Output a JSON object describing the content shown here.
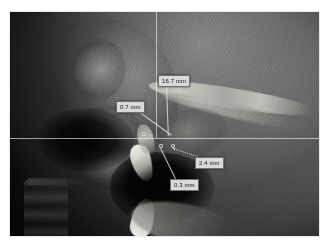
{
  "viewer": {
    "title": "CBCT Sagittal Slice Viewer",
    "modality": "CBCT sagittal slice",
    "frame_border_color": "#ffffff",
    "background_color": "#050505"
  },
  "crosshair": {
    "color": "#f4f4f4",
    "horizontal_y": 126,
    "vertical_x": 146
  },
  "measurements": [
    {
      "id": "measurement-1",
      "name": "airway-length",
      "value": "16.7 mm",
      "label_x": 148,
      "label_y": 63,
      "leader_x": 157,
      "leader_y": 72,
      "leader_length": 52,
      "leader_angle": 88
    },
    {
      "id": "measurement-2",
      "name": "anterior-gap",
      "value": "0.7 mm",
      "label_x": 106,
      "label_y": 89,
      "leader_x": 126,
      "leader_y": 97,
      "leader_length": 44,
      "leader_angle": 36
    },
    {
      "id": "measurement-3",
      "name": "posterior-gap",
      "value": "2.4 mm",
      "label_x": 185,
      "label_y": 145,
      "leader_x": 163,
      "leader_y": 136,
      "leader_length": 26,
      "leader_angle": 18
    },
    {
      "id": "measurement-4",
      "name": "inferior-gap",
      "value": "0.3 mm",
      "label_x": 160,
      "label_y": 167,
      "leader_x": 151,
      "leader_y": 136,
      "leader_length": 36,
      "leader_angle": 64
    }
  ],
  "nodes": [
    {
      "name": "node-anterior",
      "x": 134,
      "y": 122
    },
    {
      "name": "node-center",
      "x": 151,
      "y": 134
    },
    {
      "name": "node-posterior",
      "x": 163,
      "y": 134
    }
  ],
  "icons": {
    "crosshair": "crosshair-icon",
    "measure": "ruler-icon"
  }
}
